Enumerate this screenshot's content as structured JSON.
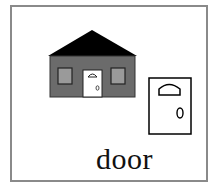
{
  "card": {
    "word": "door",
    "border_color": "#8a8a8a"
  },
  "illustrations": {
    "house": {
      "roof_color": "#000000",
      "wall_color": "#6b6b6b",
      "window_color": "#9a9a9a",
      "door_color": "#ffffff"
    },
    "door": {
      "fill": "#ffffff",
      "stroke": "#000000"
    }
  }
}
